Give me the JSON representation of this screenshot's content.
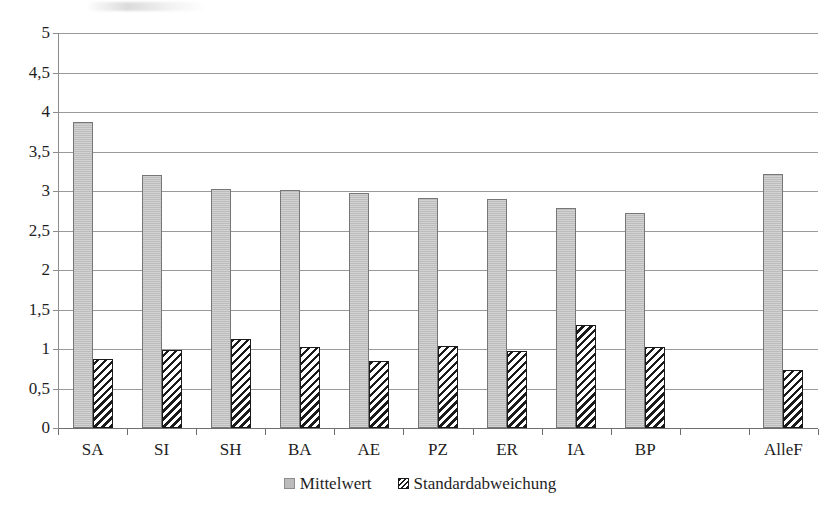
{
  "chart_data": {
    "type": "bar",
    "title": "",
    "xlabel": "",
    "ylabel": "",
    "ylim": [
      0,
      5
    ],
    "ytick_step": 0.5,
    "ytick_labels": [
      "5",
      "4,5",
      "4",
      "3,5",
      "3",
      "2,5",
      "2",
      "1,5",
      "1",
      "0,5",
      "0"
    ],
    "ytick_values": [
      5,
      4.5,
      4,
      3.5,
      3,
      2.5,
      2,
      1.5,
      1,
      0.5,
      0
    ],
    "grid": true,
    "grid_axis": "y",
    "legend_position": "bottom-center",
    "decimal_separator": ",",
    "categories": [
      "SA",
      "SI",
      "SH",
      "BA",
      "AE",
      "PZ",
      "ER",
      "IA",
      "BP",
      "",
      "AlleF"
    ],
    "series": [
      {
        "name": "Mittelwert",
        "fill": "solid-gray",
        "color": "#bcbcbc",
        "values": [
          3.87,
          3.2,
          3.03,
          3.01,
          2.97,
          2.91,
          2.9,
          2.79,
          2.72,
          null,
          3.21
        ]
      },
      {
        "name": "Standardabweichung",
        "fill": "diagonal-hatch",
        "color": "#1b1b1b",
        "values": [
          0.87,
          0.99,
          1.13,
          1.03,
          0.85,
          1.04,
          0.98,
          1.31,
          1.03,
          null,
          0.74
        ]
      }
    ]
  },
  "legend": {
    "items": [
      {
        "label": "Mittelwert",
        "swatch": "gray-square-swatch"
      },
      {
        "label": "Standardabweichung",
        "swatch": "hatched-square-swatch"
      }
    ]
  },
  "colors": {
    "mean_fill": "#bcbcbc",
    "mean_border": "#777777",
    "sd_border": "#1b1b1b",
    "gridline": "#9a9a9a",
    "axis": "#6f6f6f",
    "text": "#1e1e1e",
    "background": "#ffffff"
  }
}
